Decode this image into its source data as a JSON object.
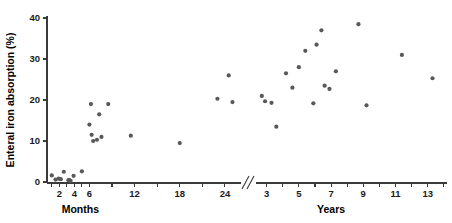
{
  "chart_data": {
    "type": "scatter",
    "title": "",
    "ylabel": "Enteral iron absorption (%)",
    "ylim": [
      0,
      42
    ],
    "yticks": [
      0,
      10,
      20,
      30,
      40
    ],
    "grid": false,
    "legend": null,
    "axis_break": true,
    "xaxis_segments": [
      {
        "name": "Months",
        "label": "Months",
        "unit": "months",
        "ticks": [
          2,
          4,
          6,
          12,
          18,
          24
        ],
        "minor_ticks": [
          1,
          3,
          5,
          9,
          15,
          21
        ],
        "range": [
          0.5,
          26
        ]
      },
      {
        "name": "Years",
        "label": "Years",
        "unit": "years",
        "ticks": [
          3,
          5,
          7,
          9,
          11,
          13
        ],
        "minor_ticks": [
          2,
          4,
          6,
          8,
          10,
          12,
          14
        ],
        "range": [
          2.4,
          14.2
        ]
      }
    ],
    "series": [
      {
        "name": "Enteral iron absorption",
        "marker": "circle",
        "color": "#58585b",
        "points_months": [
          {
            "x": 1.0,
            "y": 1.6
          },
          {
            "x": 1.5,
            "y": 0.6
          },
          {
            "x": 1.9,
            "y": 0.8
          },
          {
            "x": 2.2,
            "y": 0.7
          },
          {
            "x": 2.6,
            "y": 2.5
          },
          {
            "x": 3.2,
            "y": 0.4
          },
          {
            "x": 3.3,
            "y": 0.5
          },
          {
            "x": 3.5,
            "y": 0.3
          },
          {
            "x": 3.9,
            "y": 1.5
          },
          {
            "x": 5.0,
            "y": 2.6
          },
          {
            "x": 6.0,
            "y": 14.0
          },
          {
            "x": 6.2,
            "y": 19.0
          },
          {
            "x": 6.3,
            "y": 11.5
          },
          {
            "x": 6.5,
            "y": 10.0
          },
          {
            "x": 7.0,
            "y": 10.3
          },
          {
            "x": 7.3,
            "y": 16.5
          },
          {
            "x": 7.6,
            "y": 11.0
          },
          {
            "x": 8.5,
            "y": 19.0
          },
          {
            "x": 11.5,
            "y": 11.3
          },
          {
            "x": 18.0,
            "y": 9.5
          },
          {
            "x": 23.0,
            "y": 20.3
          },
          {
            "x": 24.5,
            "y": 26.0
          },
          {
            "x": 25.0,
            "y": 19.5
          }
        ],
        "points_years": [
          {
            "x": 2.7,
            "y": 21.0
          },
          {
            "x": 2.9,
            "y": 19.7
          },
          {
            "x": 3.3,
            "y": 19.3
          },
          {
            "x": 3.6,
            "y": 13.5
          },
          {
            "x": 4.2,
            "y": 26.5
          },
          {
            "x": 4.6,
            "y": 23.0
          },
          {
            "x": 5.0,
            "y": 28.0
          },
          {
            "x": 5.4,
            "y": 32.0
          },
          {
            "x": 5.9,
            "y": 19.2
          },
          {
            "x": 6.1,
            "y": 33.5
          },
          {
            "x": 6.4,
            "y": 37.0
          },
          {
            "x": 6.6,
            "y": 23.5
          },
          {
            "x": 6.9,
            "y": 22.7
          },
          {
            "x": 7.3,
            "y": 27.0
          },
          {
            "x": 8.7,
            "y": 38.5
          },
          {
            "x": 9.2,
            "y": 18.7
          },
          {
            "x": 11.4,
            "y": 31.0
          },
          {
            "x": 13.3,
            "y": 25.3
          }
        ]
      }
    ]
  }
}
